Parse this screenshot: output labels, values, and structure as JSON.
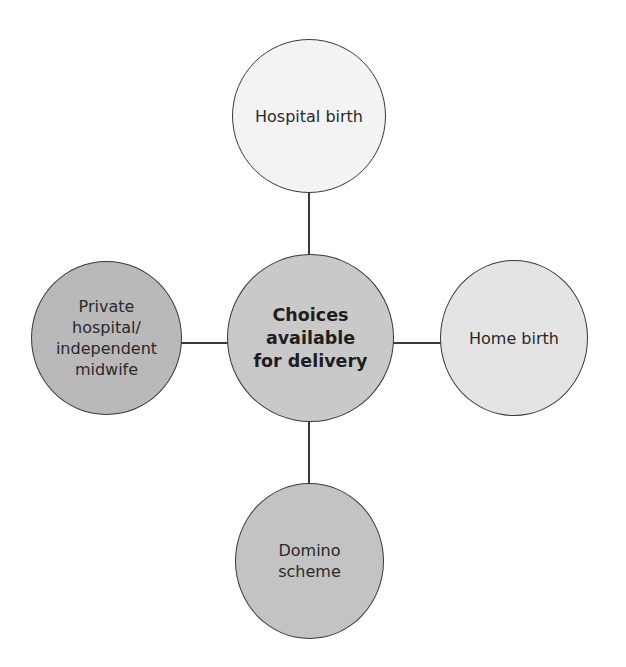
{
  "diagram": {
    "type": "hub-and-spoke",
    "center": {
      "label": "Choices\navailable\nfor delivery",
      "fill": "#c9c9c9"
    },
    "nodes": [
      {
        "id": "top",
        "label": "Hospital birth",
        "fill": "#f3f3f3"
      },
      {
        "id": "left",
        "label": "Private\nhospital/\nindependent\nmidwife",
        "fill": "#b9b9b9"
      },
      {
        "id": "right",
        "label": "Home birth",
        "fill": "#e4e4e4"
      },
      {
        "id": "bottom",
        "label": "Domino\nscheme",
        "fill": "#c3c3c3"
      }
    ],
    "edge_color": "#3a3a3a"
  }
}
